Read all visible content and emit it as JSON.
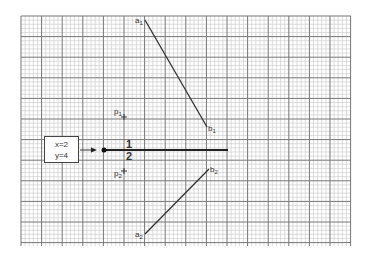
{
  "grid": {
    "left": 21,
    "top": 16,
    "right": 351,
    "bottom": 246,
    "major_spacing": 20.6,
    "minor_divisions": 5,
    "minor_color": "#c8c8c8",
    "major_color": "#777777"
  },
  "segments": [
    {
      "id": "segment-1",
      "start_label": "a",
      "start_sub": "1",
      "end_label": "b",
      "end_sub": "1",
      "x1": 145,
      "y1": 20,
      "x2": 207,
      "y2": 127
    },
    {
      "id": "segment-2",
      "start_label": "a",
      "start_sub": "2",
      "end_label": "b",
      "end_sub": "2",
      "x1": 145,
      "y1": 234,
      "x2": 209,
      "y2": 169
    }
  ],
  "points": [
    {
      "id": "p1",
      "label": "p",
      "sub": "1",
      "x": 124,
      "y": 117
    },
    {
      "id": "p2",
      "label": "p",
      "sub": "2",
      "x": 124,
      "y": 171
    }
  ],
  "dividing_line": {
    "y": 150,
    "x_start": 104,
    "x_end": 228,
    "arrow_x": 93,
    "label_above": "1",
    "label_below": "2",
    "label_x": 129
  },
  "info_box": {
    "line1": "x=2",
    "line2": "y=4"
  },
  "colors": {
    "line": "#333333",
    "text": "#333333",
    "background": "#ffffff"
  }
}
